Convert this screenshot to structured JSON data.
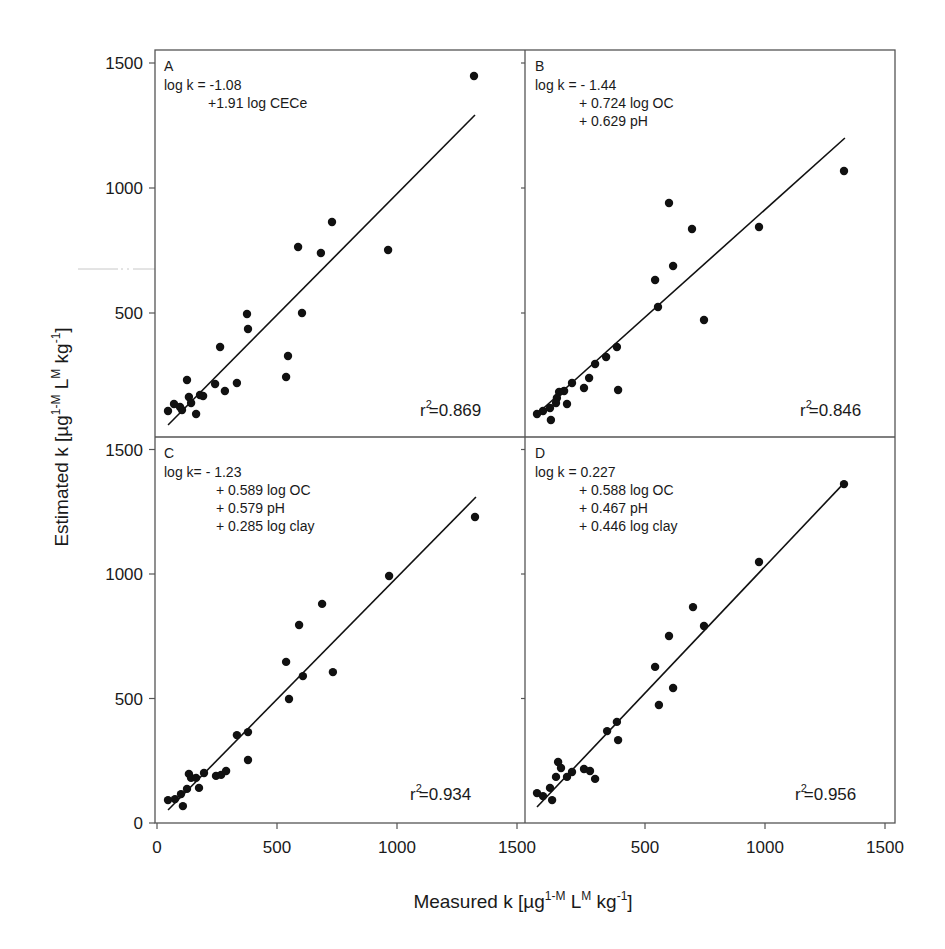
{
  "chart_data": {
    "type": "scatter",
    "layout": "2x2 shared-axis panels",
    "xlabel": "Measured k",
    "xlabel_units": {
      "prefix": "[µg",
      "sup1": "1-M",
      "mid": " L",
      "sup2": "M",
      "mid2": " kg",
      "sup3": "-1",
      "suffix": "]"
    },
    "ylabel": "Estimated k",
    "ylabel_units": {
      "prefix": "[µg",
      "sup1": "1-M",
      "mid": " L",
      "sup2": "M",
      "mid2": " kg",
      "sup3": "-1",
      "suffix": "]"
    },
    "xlim": [
      0,
      1500
    ],
    "ylim": [
      0,
      1500
    ],
    "xticks": [
      0,
      500,
      1000,
      1500
    ],
    "yticks": [
      0,
      500,
      1000,
      1500
    ],
    "xtick_labels_left": [
      "0",
      "500",
      "1000",
      "1500"
    ],
    "xtick_labels_right": [
      "500",
      "1000",
      "1500"
    ],
    "ytick_labels_top": [
      "500",
      "1000",
      "1500"
    ],
    "ytick_labels_bottom": [
      "0",
      "500",
      "1000",
      "1500"
    ],
    "grid": false,
    "panels": [
      {
        "id": "A",
        "letter": "A",
        "equation": [
          "log k =  -1.08",
          "+1.91 log CECe"
        ],
        "r2_label": "r",
        "r2_value": "=0.869",
        "fit_line": [
          [
            46,
            52
          ],
          [
            1325,
            1292
          ]
        ],
        "points": [
          [
            1321,
            1448
          ],
          [
            729,
            864
          ],
          [
            588,
            764
          ],
          [
            683,
            740
          ],
          [
            963,
            752
          ],
          [
            375,
            496
          ],
          [
            379,
            436
          ],
          [
            604,
            500
          ],
          [
            263,
            364
          ],
          [
            546,
            328
          ],
          [
            538,
            244
          ],
          [
            125,
            232
          ],
          [
            242,
            216
          ],
          [
            333,
            220
          ],
          [
            283,
            188
          ],
          [
            179,
            172
          ],
          [
            192,
            168
          ],
          [
            133,
            164
          ],
          [
            142,
            140
          ],
          [
            71,
            136
          ],
          [
            96,
            124
          ],
          [
            46,
            108
          ],
          [
            104,
            112
          ],
          [
            163,
            96
          ]
        ]
      },
      {
        "id": "B",
        "letter": "B",
        "equation": [
          "log k = - 1.44",
          "+ 0.724 log OC",
          "+ 0.629 pH"
        ],
        "r2_label": "r",
        "r2_value": "=0.846",
        "fit_line": [
          [
            50,
            96
          ],
          [
            1333,
            1200
          ]
        ],
        "points": [
          [
            600,
            940
          ],
          [
            696,
            836
          ],
          [
            975,
            844
          ],
          [
            1329,
            1068
          ],
          [
            617,
            688
          ],
          [
            542,
            632
          ],
          [
            554,
            524
          ],
          [
            746,
            472
          ],
          [
            383,
            364
          ],
          [
            338,
            324
          ],
          [
            292,
            296
          ],
          [
            267,
            240
          ],
          [
            246,
            200
          ],
          [
            388,
            192
          ],
          [
            196,
            220
          ],
          [
            163,
            188
          ],
          [
            142,
            184
          ],
          [
            133,
            160
          ],
          [
            129,
            140
          ],
          [
            175,
            136
          ],
          [
            104,
            120
          ],
          [
            75,
            108
          ],
          [
            50,
            96
          ],
          [
            108,
            72
          ]
        ]
      },
      {
        "id": "C",
        "letter": "C",
        "equation": [
          "log k=   - 1.23",
          "+ 0.589 log OC",
          "+ 0.579 pH",
          "+ 0.285 log clay"
        ],
        "r2_label": "r",
        "r2_value": "=0.934",
        "fit_line": [
          [
            46,
            52
          ],
          [
            1329,
            1309
          ]
        ],
        "points": [
          [
            1325,
            1229
          ],
          [
            967,
            992
          ],
          [
            688,
            880
          ],
          [
            592,
            795
          ],
          [
            538,
            647
          ],
          [
            733,
            606
          ],
          [
            608,
            590
          ],
          [
            550,
            498
          ],
          [
            333,
            353
          ],
          [
            379,
            365
          ],
          [
            379,
            253
          ],
          [
            196,
            201
          ],
          [
            133,
            197
          ],
          [
            142,
            181
          ],
          [
            163,
            181
          ],
          [
            246,
            189
          ],
          [
            267,
            193
          ],
          [
            288,
            209
          ],
          [
            125,
            137
          ],
          [
            100,
            116
          ],
          [
            175,
            141
          ],
          [
            75,
            96
          ],
          [
            46,
            92
          ],
          [
            108,
            68
          ]
        ]
      },
      {
        "id": "D",
        "letter": "D",
        "equation": [
          "log k = 0.227",
          "+ 0.588 log OC",
          "+ 0.467 pH",
          "+ 0.446 log clay"
        ],
        "r2_label": "r",
        "r2_value": "=0.956",
        "fit_line": [
          [
            50,
            64
          ],
          [
            1333,
            1369
          ]
        ],
        "points": [
          [
            1329,
            1361
          ],
          [
            975,
            1048
          ],
          [
            700,
            867
          ],
          [
            746,
            791
          ],
          [
            600,
            751
          ],
          [
            542,
            627
          ],
          [
            617,
            542
          ],
          [
            558,
            474
          ],
          [
            383,
            406
          ],
          [
            342,
            369
          ],
          [
            388,
            333
          ],
          [
            138,
            245
          ],
          [
            150,
            221
          ],
          [
            246,
            217
          ],
          [
            271,
            209
          ],
          [
            292,
            177
          ],
          [
            196,
            205
          ],
          [
            175,
            185
          ],
          [
            129,
            185
          ],
          [
            104,
            141
          ],
          [
            50,
            120
          ],
          [
            75,
            108
          ],
          [
            113,
            92
          ]
        ]
      }
    ]
  },
  "colors": {
    "frame": "#555555",
    "points": "#111111",
    "line": "#111111",
    "artifact": "#c8c8c8"
  }
}
